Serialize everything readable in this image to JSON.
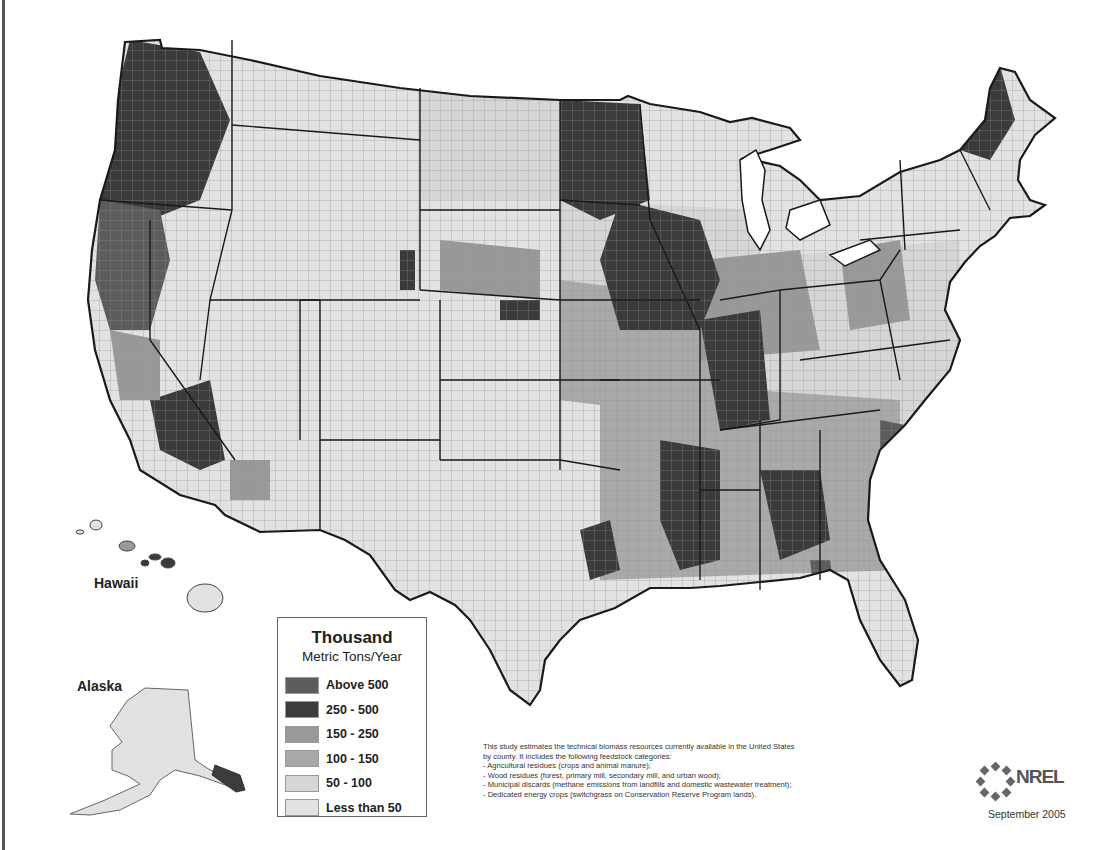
{
  "map": {
    "subject": "Technical biomass resources by county, United States",
    "inset_labels": {
      "hawaii": "Hawaii",
      "alaska": "Alaska"
    },
    "legend": {
      "title": "Thousand",
      "subtitle": "Metric Tons/Year",
      "classes": [
        {
          "label": "Above 500",
          "color": "#5c5c5c"
        },
        {
          "label": "250 - 500",
          "color": "#3b3b3b"
        },
        {
          "label": "150 - 250",
          "color": "#999999"
        },
        {
          "label": "100 - 150",
          "color": "#a9a9a9"
        },
        {
          "label": "50 - 100",
          "color": "#d6d6d6"
        },
        {
          "label": "Less than 50",
          "color": "#e2e2e2"
        }
      ]
    },
    "notes": {
      "lines": [
        "This study estimates the technical biomass resources currently available in the United States",
        "by county. It includes the following feedstock categories:",
        " - Agricultural residues (crops and animal manure);",
        " - Wood residues (forest, primary mill, secondary mill, and urban wood);",
        " - Municipal discards (methane emissions from landfills and domestic wastewater treatment);",
        " - Dedicated energy crops (switchgrass on Conservation Reserve Program lands)."
      ]
    },
    "credit": {
      "logo_text": "NREL",
      "date": "September 2005"
    },
    "colors": {
      "border": "#1a1a1a",
      "county_line": "#8a8a8a",
      "frame": "#555555"
    }
  }
}
